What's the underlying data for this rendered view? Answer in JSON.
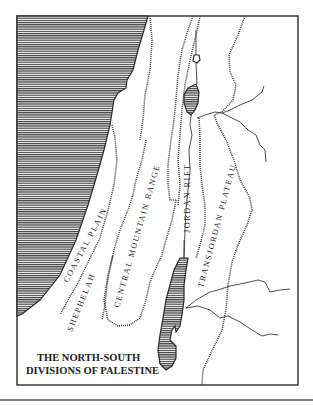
{
  "map": {
    "title_line1": "THE NORTH-SOUTH",
    "title_line2": "DIVISIONS OF PALESTINE",
    "regions": [
      {
        "id": "coastal-plain",
        "label": "COASTAL PLAIN"
      },
      {
        "id": "shephelah",
        "label": "SHEPHELAH"
      },
      {
        "id": "central-mountain-range",
        "label": "CENTRAL MOUNTAIN RANGE"
      },
      {
        "id": "jordan-rift",
        "label": "JORDAN RIFT"
      },
      {
        "id": "transjordan-plateau",
        "label": "TRANSJORDAN PLATEAU"
      }
    ],
    "water_bodies": [
      {
        "id": "mediterranean-sea",
        "fill": "hatched"
      },
      {
        "id": "sea-of-galilee",
        "fill": "hatched"
      },
      {
        "id": "dead-sea",
        "fill": "hatched"
      },
      {
        "id": "lake-huleh",
        "fill": "outline"
      }
    ],
    "colors": {
      "ink": "#2a2a2a",
      "paper": "#ffffff"
    }
  }
}
